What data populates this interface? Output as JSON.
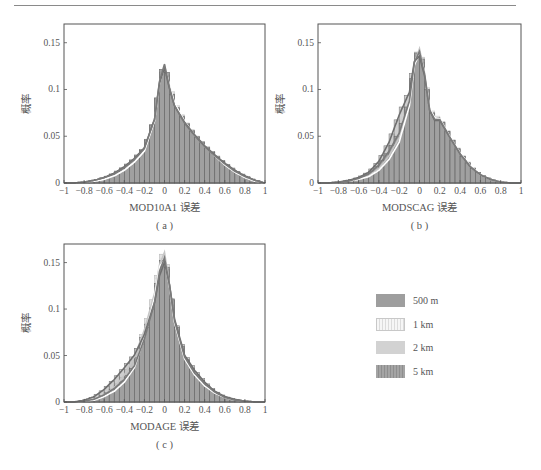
{
  "legend": {
    "items": [
      {
        "label": "500 m",
        "color": "#9e9e9e",
        "pattern": "solid"
      },
      {
        "label": "1 km",
        "color": "#f4f4f4",
        "pattern": "vertical-hatch-light"
      },
      {
        "label": "2 km",
        "color": "#d2d2d2",
        "pattern": "solid"
      },
      {
        "label": "5 km",
        "color": "#a8a8a8",
        "pattern": "vertical-hatch"
      }
    ]
  },
  "chart_data": [
    {
      "type": "bar",
      "panel": "(a)",
      "title": "",
      "xlabel": "MOD10A1 误差",
      "ylabel": "概率",
      "xlim": [
        -1,
        1
      ],
      "ylim": [
        0,
        0.17
      ],
      "xticks": [
        "-1",
        "-0.8",
        "-0.6",
        "-0.4",
        "-0.2",
        "0",
        "0.2",
        "0.4",
        "0.6",
        "0.8",
        "1"
      ],
      "yticks": [
        "0",
        "0.05",
        "0.1",
        "0.15"
      ],
      "grid": false,
      "legend_position": "shared-right",
      "x": [
        -0.9,
        -0.8,
        -0.7,
        -0.6,
        -0.5,
        -0.4,
        -0.3,
        -0.2,
        -0.1,
        -0.05,
        0.0,
        0.05,
        0.1,
        0.2,
        0.3,
        0.4,
        0.5,
        0.6,
        0.7,
        0.8,
        0.9,
        1.0
      ],
      "series": [
        {
          "name": "500 m",
          "values": [
            0.0,
            0.001,
            0.003,
            0.006,
            0.01,
            0.017,
            0.026,
            0.038,
            0.07,
            0.112,
            0.131,
            0.105,
            0.085,
            0.066,
            0.052,
            0.04,
            0.03,
            0.021,
            0.013,
            0.007,
            0.003,
            0.0
          ]
        },
        {
          "name": "1 km",
          "values": [
            0.0,
            0.001,
            0.002,
            0.004,
            0.008,
            0.014,
            0.023,
            0.035,
            0.068,
            0.11,
            0.128,
            0.108,
            0.088,
            0.068,
            0.053,
            0.041,
            0.03,
            0.02,
            0.012,
            0.006,
            0.002,
            0.0
          ]
        },
        {
          "name": "2 km",
          "values": [
            0.0,
            0.001,
            0.002,
            0.004,
            0.008,
            0.014,
            0.023,
            0.036,
            0.069,
            0.111,
            0.129,
            0.107,
            0.087,
            0.067,
            0.052,
            0.04,
            0.03,
            0.02,
            0.012,
            0.006,
            0.002,
            0.0
          ]
        },
        {
          "name": "5 km",
          "values": [
            0.0,
            0.001,
            0.003,
            0.006,
            0.011,
            0.018,
            0.027,
            0.039,
            0.07,
            0.11,
            0.127,
            0.104,
            0.085,
            0.067,
            0.053,
            0.041,
            0.031,
            0.022,
            0.014,
            0.008,
            0.003,
            0.0
          ]
        }
      ]
    },
    {
      "type": "bar",
      "panel": "(b)",
      "title": "",
      "xlabel": "MODSCAG 误差",
      "ylabel": "概率",
      "xlim": [
        -1,
        1
      ],
      "ylim": [
        0,
        0.17
      ],
      "xticks": [
        "-1",
        "-0.8",
        "-0.6",
        "-0.4",
        "-0.2",
        "0",
        "0.2",
        "0.4",
        "0.6",
        "0.8",
        "1"
      ],
      "yticks": [
        "0",
        "0.05",
        "0.1",
        "0.15"
      ],
      "grid": false,
      "legend_position": "shared-right",
      "x": [
        -0.9,
        -0.8,
        -0.7,
        -0.6,
        -0.5,
        -0.4,
        -0.3,
        -0.2,
        -0.1,
        -0.05,
        0.0,
        0.05,
        0.1,
        0.15,
        0.2,
        0.3,
        0.4,
        0.5,
        0.6,
        0.7,
        0.8,
        0.9
      ],
      "series": [
        {
          "name": "500 m",
          "values": [
            0.0,
            0.001,
            0.002,
            0.005,
            0.01,
            0.02,
            0.035,
            0.055,
            0.09,
            0.133,
            0.145,
            0.12,
            0.08,
            0.07,
            0.07,
            0.05,
            0.032,
            0.018,
            0.009,
            0.004,
            0.001,
            0.0
          ]
        },
        {
          "name": "1 km",
          "values": [
            0.0,
            0.001,
            0.002,
            0.004,
            0.007,
            0.014,
            0.026,
            0.045,
            0.085,
            0.13,
            0.143,
            0.122,
            0.082,
            0.072,
            0.071,
            0.051,
            0.033,
            0.019,
            0.009,
            0.004,
            0.001,
            0.0
          ]
        },
        {
          "name": "2 km",
          "values": [
            0.0,
            0.001,
            0.002,
            0.004,
            0.008,
            0.016,
            0.03,
            0.05,
            0.088,
            0.132,
            0.148,
            0.121,
            0.081,
            0.071,
            0.07,
            0.05,
            0.032,
            0.018,
            0.009,
            0.004,
            0.001,
            0.0
          ]
        },
        {
          "name": "5 km",
          "values": [
            0.0,
            0.001,
            0.003,
            0.006,
            0.012,
            0.024,
            0.045,
            0.075,
            0.1,
            0.134,
            0.14,
            0.118,
            0.08,
            0.069,
            0.069,
            0.05,
            0.032,
            0.018,
            0.009,
            0.004,
            0.001,
            0.0
          ]
        }
      ]
    },
    {
      "type": "bar",
      "panel": "(c)",
      "title": "",
      "xlabel": "MODAGE 误差",
      "ylabel": "概率",
      "xlim": [
        -1,
        1
      ],
      "ylim": [
        0,
        0.17
      ],
      "xticks": [
        "-1",
        "-0.8",
        "-0.6",
        "-0.4",
        "-0.2",
        "0",
        "0.2",
        "0.4",
        "0.6",
        "0.8",
        "1"
      ],
      "yticks": [
        "0",
        "0.05",
        "0.1",
        "0.15"
      ],
      "grid": false,
      "legend_position": "shared-right",
      "x": [
        -0.9,
        -0.8,
        -0.7,
        -0.6,
        -0.5,
        -0.4,
        -0.3,
        -0.2,
        -0.1,
        -0.05,
        0.0,
        0.05,
        0.1,
        0.2,
        0.3,
        0.4,
        0.5,
        0.6,
        0.7,
        0.8,
        0.9
      ],
      "series": [
        {
          "name": "500 m",
          "values": [
            0.0,
            0.001,
            0.003,
            0.008,
            0.015,
            0.025,
            0.04,
            0.07,
            0.11,
            0.145,
            0.16,
            0.13,
            0.09,
            0.05,
            0.032,
            0.02,
            0.011,
            0.005,
            0.002,
            0.001,
            0.0
          ]
        },
        {
          "name": "1 km",
          "values": [
            0.0,
            0.001,
            0.002,
            0.006,
            0.012,
            0.022,
            0.038,
            0.072,
            0.115,
            0.15,
            0.158,
            0.128,
            0.088,
            0.048,
            0.03,
            0.018,
            0.01,
            0.005,
            0.002,
            0.001,
            0.0
          ]
        },
        {
          "name": "2 km",
          "values": [
            0.0,
            0.001,
            0.003,
            0.008,
            0.016,
            0.03,
            0.05,
            0.08,
            0.12,
            0.152,
            0.166,
            0.13,
            0.088,
            0.048,
            0.03,
            0.018,
            0.01,
            0.005,
            0.002,
            0.001,
            0.0
          ]
        },
        {
          "name": "5 km",
          "values": [
            0.0,
            0.002,
            0.006,
            0.014,
            0.025,
            0.038,
            0.052,
            0.075,
            0.11,
            0.14,
            0.155,
            0.13,
            0.092,
            0.052,
            0.035,
            0.022,
            0.012,
            0.006,
            0.003,
            0.001,
            0.0
          ]
        }
      ]
    }
  ]
}
